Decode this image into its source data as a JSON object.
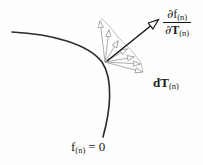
{
  "figure": {
    "background_color": "#fefefe",
    "curve": {
      "name": "yield-surface-curve",
      "color": "#2b2b2b",
      "stroke_width": 1.6,
      "label": "f(n) = 0"
    },
    "fan": {
      "name": "incremental-direction-fan",
      "color": "#8a8a8a",
      "stroke_width": 0.7,
      "origin": [
        105,
        62
      ],
      "arrow_count": 7
    },
    "gradient_arrow": {
      "name": "gradient-arrow",
      "color": "#1a1a1a",
      "stroke_width": 1.5,
      "from": [
        107,
        61
      ],
      "to": [
        160,
        19
      ]
    }
  },
  "labels": {
    "gradient": {
      "numerator_partial": "∂",
      "numerator_symbol": "f",
      "numerator_subscript": "(n)",
      "denominator_partial": "∂",
      "denominator_symbol": "T",
      "denominator_subscript": "(n)",
      "full_text": "∂f(n)/∂T(n)"
    },
    "increment": {
      "prefix": "d",
      "symbol": "T",
      "subscript": "(n)",
      "full_text": "dT(n)"
    },
    "yield_surface": {
      "symbol": "f",
      "subscript": "(n)",
      "equals": "= 0",
      "full_text": "f(n) = 0"
    }
  }
}
